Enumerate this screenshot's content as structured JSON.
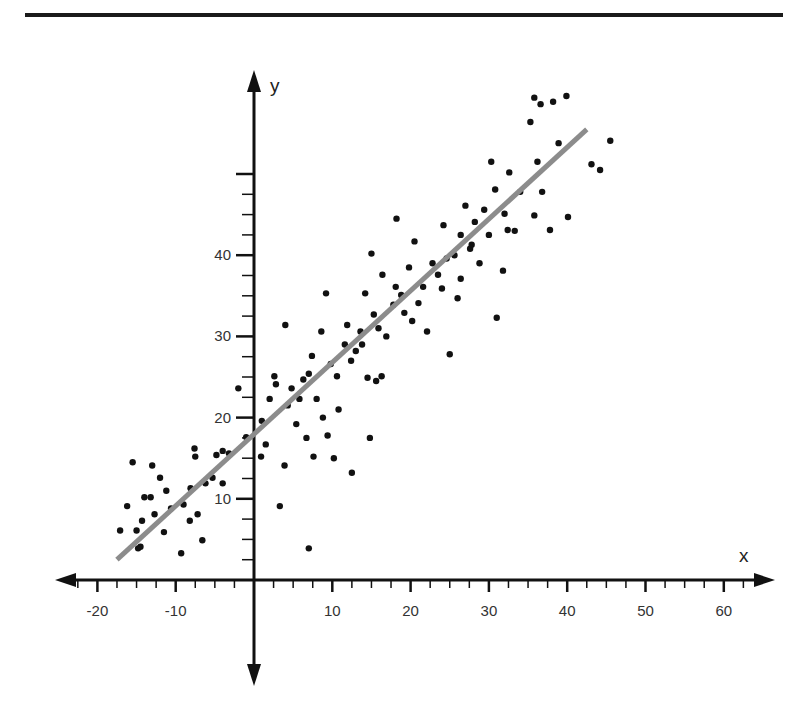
{
  "chart_data": {
    "type": "scatter",
    "title": "",
    "xlabel": "x",
    "ylabel": "y",
    "xlim": [
      -25,
      65
    ],
    "ylim": [
      -11,
      61
    ],
    "x_ticks": [
      -20,
      -10,
      10,
      20,
      30,
      40,
      50,
      60
    ],
    "x_tick_labels": [
      "-20",
      "-10",
      "10",
      "20",
      "30",
      "40",
      "50",
      "60"
    ],
    "y_ticks": [
      10,
      20,
      30,
      40
    ],
    "y_tick_labels": [
      "10",
      "20",
      "30",
      "40"
    ],
    "y_major_unlabeled": [
      50
    ],
    "minor_tick_step": 2.5,
    "grid": false,
    "legend": null,
    "regression_line": {
      "x0": -17.5,
      "y0": 2.5,
      "x1": 42.5,
      "y1": 55.5,
      "color": "#8c8c8c"
    },
    "point_color": "#111111",
    "points": [
      [
        -17.1,
        6.1
      ],
      [
        -16.2,
        9.1
      ],
      [
        -15.5,
        14.5
      ],
      [
        -15.0,
        6.1
      ],
      [
        -14.8,
        3.9
      ],
      [
        -14.5,
        4.1
      ],
      [
        -14.3,
        7.3
      ],
      [
        -14.0,
        10.2
      ],
      [
        -13.2,
        10.2
      ],
      [
        -12.7,
        8.1
      ],
      [
        -13.0,
        14.1
      ],
      [
        -12.0,
        12.6
      ],
      [
        -11.5,
        5.9
      ],
      [
        -11.2,
        11.0
      ],
      [
        -10.6,
        8.8
      ],
      [
        -9.3,
        3.3
      ],
      [
        -9.0,
        9.3
      ],
      [
        -8.2,
        7.3
      ],
      [
        -8.1,
        11.3
      ],
      [
        -7.6,
        16.2
      ],
      [
        -7.5,
        15.2
      ],
      [
        -7.2,
        8.1
      ],
      [
        -6.6,
        4.9
      ],
      [
        -6.2,
        11.9
      ],
      [
        -5.3,
        12.6
      ],
      [
        -4.8,
        15.4
      ],
      [
        -4.0,
        15.9
      ],
      [
        -4.0,
        11.9
      ],
      [
        -3.2,
        15.6
      ],
      [
        -2.0,
        23.6
      ],
      [
        -1.0,
        17.6
      ],
      [
        1.0,
        19.6
      ],
      [
        0.9,
        15.2
      ],
      [
        1.5,
        16.7
      ],
      [
        2.0,
        22.3
      ],
      [
        2.6,
        25.1
      ],
      [
        2.8,
        24.1
      ],
      [
        3.3,
        9.1
      ],
      [
        3.9,
        14.1
      ],
      [
        4.0,
        31.4
      ],
      [
        4.3,
        21.5
      ],
      [
        4.8,
        23.6
      ],
      [
        5.4,
        19.2
      ],
      [
        5.8,
        22.3
      ],
      [
        6.3,
        24.7
      ],
      [
        6.7,
        17.5
      ],
      [
        7.0,
        3.9
      ],
      [
        7.6,
        15.2
      ],
      [
        7.0,
        25.4
      ],
      [
        7.4,
        27.6
      ],
      [
        8.0,
        22.3
      ],
      [
        8.6,
        30.6
      ],
      [
        8.8,
        20.0
      ],
      [
        9.4,
        17.8
      ],
      [
        9.2,
        35.3
      ],
      [
        9.8,
        26.6
      ],
      [
        10.2,
        15.0
      ],
      [
        10.8,
        21.0
      ],
      [
        10.6,
        25.1
      ],
      [
        11.6,
        29.0
      ],
      [
        11.9,
        31.4
      ],
      [
        12.4,
        27.0
      ],
      [
        12.5,
        13.2
      ],
      [
        13.0,
        28.2
      ],
      [
        13.6,
        30.6
      ],
      [
        13.8,
        29.0
      ],
      [
        14.2,
        35.3
      ],
      [
        14.8,
        17.5
      ],
      [
        14.5,
        24.9
      ],
      [
        15.0,
        40.2
      ],
      [
        15.3,
        32.7
      ],
      [
        15.6,
        24.5
      ],
      [
        15.9,
        31.0
      ],
      [
        16.3,
        25.1
      ],
      [
        16.4,
        37.6
      ],
      [
        16.9,
        30.0
      ],
      [
        17.8,
        33.9
      ],
      [
        18.1,
        36.1
      ],
      [
        18.2,
        44.5
      ],
      [
        18.8,
        35.1
      ],
      [
        19.2,
        32.9
      ],
      [
        19.8,
        38.5
      ],
      [
        20.2,
        31.9
      ],
      [
        20.5,
        41.7
      ],
      [
        21.0,
        34.1
      ],
      [
        21.6,
        36.1
      ],
      [
        22.1,
        30.6
      ],
      [
        22.8,
        39.0
      ],
      [
        23.5,
        37.6
      ],
      [
        24.0,
        35.9
      ],
      [
        24.2,
        43.7
      ],
      [
        24.6,
        39.6
      ],
      [
        25.0,
        27.8
      ],
      [
        25.6,
        40.0
      ],
      [
        26.0,
        34.7
      ],
      [
        26.4,
        42.5
      ],
      [
        26.4,
        37.1
      ],
      [
        27.0,
        46.1
      ],
      [
        27.6,
        40.8
      ],
      [
        27.8,
        41.3
      ],
      [
        28.2,
        44.1
      ],
      [
        28.8,
        39.0
      ],
      [
        29.4,
        45.6
      ],
      [
        30.0,
        42.5
      ],
      [
        30.3,
        51.5
      ],
      [
        30.8,
        48.1
      ],
      [
        31.0,
        32.3
      ],
      [
        31.8,
        38.1
      ],
      [
        32.0,
        45.1
      ],
      [
        32.4,
        43.1
      ],
      [
        32.6,
        50.2
      ],
      [
        33.3,
        43.0
      ],
      [
        34.0,
        47.8
      ],
      [
        35.3,
        56.4
      ],
      [
        35.8,
        59.4
      ],
      [
        35.8,
        44.9
      ],
      [
        36.2,
        51.5
      ],
      [
        36.6,
        58.6
      ],
      [
        36.8,
        47.8
      ],
      [
        37.8,
        43.1
      ],
      [
        38.2,
        58.9
      ],
      [
        38.9,
        53.8
      ],
      [
        39.9,
        59.6
      ],
      [
        40.1,
        44.7
      ],
      [
        43.1,
        51.2
      ],
      [
        44.2,
        50.5
      ],
      [
        45.5,
        54.1
      ]
    ]
  }
}
